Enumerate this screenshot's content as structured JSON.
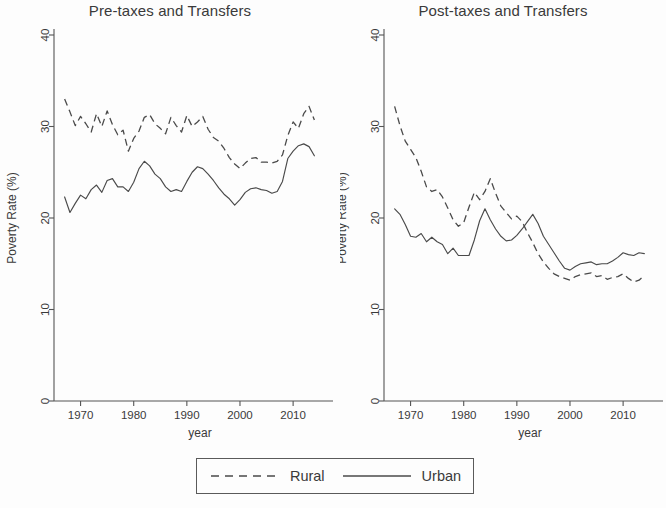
{
  "figure": {
    "y_axis_title": "Poverty Rate (%)",
    "x_axis_title": "year"
  },
  "legend": {
    "entries": [
      {
        "label": "Rural",
        "style": "dashed",
        "key_name": "legend-key-rural"
      },
      {
        "label": "Urban",
        "style": "solid",
        "key_name": "legend-key-urban"
      }
    ]
  },
  "panels": [
    {
      "title": "Pre-taxes and Transfers"
    },
    {
      "title": "Post-taxes and Transfers"
    }
  ],
  "chart_data": [
    {
      "type": "line",
      "title": "Pre-taxes and Transfers",
      "xlabel": "year",
      "ylabel": "Poverty Rate (%)",
      "xlim": [
        1965,
        2016
      ],
      "ylim": [
        0,
        40
      ],
      "yticks": [
        0,
        10,
        20,
        30,
        40
      ],
      "xticks": [
        1970,
        1980,
        1990,
        2000,
        2010
      ],
      "grid": false,
      "legend_position": "bottom-outside",
      "x": [
        1967,
        1968,
        1969,
        1970,
        1971,
        1972,
        1973,
        1974,
        1975,
        1976,
        1977,
        1978,
        1979,
        1980,
        1981,
        1982,
        1983,
        1984,
        1985,
        1986,
        1987,
        1988,
        1989,
        1990,
        1991,
        1992,
        1993,
        1994,
        1995,
        1996,
        1997,
        1998,
        1999,
        2000,
        2001,
        2002,
        2003,
        2004,
        2005,
        2006,
        2007,
        2008,
        2009,
        2010,
        2011,
        2012,
        2013,
        2014
      ],
      "series": [
        {
          "name": "Rural",
          "values": [
            33.0,
            31.6,
            30.1,
            31.1,
            30.3,
            29.4,
            31.4,
            30.0,
            31.7,
            30.2,
            29.1,
            29.6,
            27.3,
            28.7,
            29.5,
            31.0,
            31.3,
            30.3,
            29.8,
            29.2,
            31.0,
            30.1,
            29.4,
            31.2,
            30.0,
            30.5,
            31.1,
            29.7,
            28.8,
            28.4,
            27.6,
            26.6,
            25.9,
            25.4,
            26.0,
            26.5,
            26.6,
            26.1,
            26.1,
            26.0,
            26.2,
            26.9,
            29.0,
            30.5,
            29.8,
            31.4,
            32.2,
            30.7
          ]
        },
        {
          "name": "Urban",
          "values": [
            22.3,
            20.6,
            21.6,
            22.5,
            22.1,
            23.1,
            23.6,
            22.8,
            24.1,
            24.3,
            23.4,
            23.4,
            22.9,
            23.9,
            25.4,
            26.2,
            25.7,
            24.8,
            24.3,
            23.4,
            22.9,
            23.1,
            22.9,
            24.0,
            25.0,
            25.6,
            25.4,
            24.8,
            24.1,
            23.3,
            22.6,
            22.1,
            21.4,
            22.0,
            22.8,
            23.2,
            23.3,
            23.1,
            23.0,
            22.7,
            22.9,
            24.0,
            26.5,
            27.3,
            27.9,
            28.1,
            27.8,
            26.8
          ]
        }
      ]
    },
    {
      "type": "line",
      "title": "Post-taxes and Transfers",
      "xlabel": "year",
      "ylabel": "Poverty Rate (%)",
      "xlim": [
        1965,
        2016
      ],
      "ylim": [
        0,
        40
      ],
      "yticks": [
        0,
        10,
        20,
        30,
        40
      ],
      "xticks": [
        1970,
        1980,
        1990,
        2000,
        2010
      ],
      "grid": false,
      "legend_position": "bottom-outside",
      "x": [
        1967,
        1968,
        1969,
        1970,
        1971,
        1972,
        1973,
        1974,
        1975,
        1976,
        1977,
        1978,
        1979,
        1980,
        1981,
        1982,
        1983,
        1984,
        1985,
        1986,
        1987,
        1988,
        1989,
        1990,
        1991,
        1992,
        1993,
        1994,
        1995,
        1996,
        1997,
        1998,
        1999,
        2000,
        2001,
        2002,
        2003,
        2004,
        2005,
        2006,
        2007,
        2008,
        2009,
        2010,
        2011,
        2012,
        2013,
        2014
      ],
      "series": [
        {
          "name": "Rural",
          "values": [
            32.2,
            30.1,
            28.4,
            27.5,
            26.6,
            25.1,
            23.4,
            22.9,
            23.1,
            22.3,
            21.1,
            19.8,
            19.1,
            19.5,
            21.2,
            22.8,
            22.0,
            22.9,
            24.3,
            22.7,
            21.3,
            20.6,
            19.9,
            20.2,
            19.6,
            18.4,
            17.3,
            16.1,
            15.2,
            14.5,
            13.9,
            13.6,
            13.4,
            13.2,
            13.6,
            13.8,
            13.9,
            14.0,
            13.6,
            13.7,
            13.3,
            13.5,
            13.6,
            13.9,
            13.4,
            13.0,
            13.2,
            13.7
          ]
        },
        {
          "name": "Urban",
          "values": [
            21.0,
            20.4,
            19.3,
            18.0,
            17.9,
            18.3,
            17.4,
            17.9,
            17.4,
            17.1,
            16.1,
            16.7,
            15.9,
            15.9,
            15.9,
            17.6,
            19.7,
            21.0,
            19.8,
            18.8,
            18.0,
            17.5,
            17.6,
            18.1,
            18.8,
            19.6,
            20.4,
            19.4,
            18.0,
            17.1,
            16.2,
            15.3,
            14.5,
            14.3,
            14.7,
            15.0,
            15.1,
            15.2,
            14.9,
            15.0,
            15.0,
            15.3,
            15.7,
            16.2,
            16.0,
            15.9,
            16.2,
            16.1
          ]
        }
      ]
    }
  ]
}
